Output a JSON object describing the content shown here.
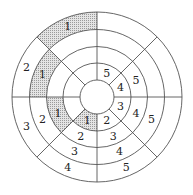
{
  "diagram": {
    "type": "polar-grid",
    "rings": 4,
    "sectors": 8,
    "shade_color": "#c8c8c8",
    "line_color": "#555555",
    "cells": [
      {
        "sector": 0,
        "ring": 1,
        "label": "4",
        "shaded": false
      },
      {
        "sector": 0,
        "ring": 2,
        "label": "5",
        "shaded": false
      },
      {
        "sector": 1,
        "ring": 1,
        "label": "5",
        "shaded": false
      },
      {
        "sector": 2,
        "ring": 4,
        "label": "1",
        "shaded": true
      },
      {
        "sector": 3,
        "ring": 3,
        "label": "1",
        "shaded": true
      },
      {
        "sector": 3,
        "ring": 4,
        "label": "2",
        "shaded": false
      },
      {
        "sector": 4,
        "ring": 2,
        "label": "1",
        "shaded": true
      },
      {
        "sector": 4,
        "ring": 3,
        "label": "2",
        "shaded": false
      },
      {
        "sector": 4,
        "ring": 4,
        "label": "3",
        "shaded": false
      },
      {
        "sector": 5,
        "ring": 1,
        "label": "1",
        "shaded": true
      },
      {
        "sector": 5,
        "ring": 2,
        "label": "2",
        "shaded": false
      },
      {
        "sector": 5,
        "ring": 3,
        "label": "3",
        "shaded": false
      },
      {
        "sector": 5,
        "ring": 4,
        "label": "4",
        "shaded": false
      },
      {
        "sector": 6,
        "ring": 1,
        "label": "2",
        "shaded": false
      },
      {
        "sector": 6,
        "ring": 2,
        "label": "3",
        "shaded": false
      },
      {
        "sector": 6,
        "ring": 3,
        "label": "4",
        "shaded": false
      },
      {
        "sector": 6,
        "ring": 4,
        "label": "5",
        "shaded": false
      },
      {
        "sector": 7,
        "ring": 1,
        "label": "3",
        "shaded": false
      },
      {
        "sector": 7,
        "ring": 2,
        "label": "4",
        "shaded": false
      },
      {
        "sector": 7,
        "ring": 3,
        "label": "5",
        "shaded": false
      }
    ]
  }
}
